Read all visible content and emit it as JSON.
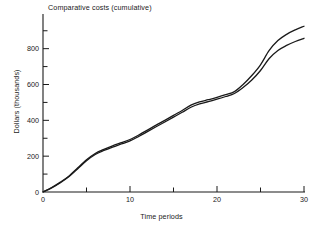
{
  "chart_data": {
    "type": "line",
    "title": "Comparative costs (cumulative)",
    "xlabel": "Time periods",
    "ylabel": "Dollars (thousands)",
    "xlim": [
      0,
      30
    ],
    "ylim": [
      0,
      960
    ],
    "grid": false,
    "legend": "none",
    "x_ticks_major": [
      0,
      10,
      20,
      30
    ],
    "x_ticks_major_labels": [
      "0",
      "10",
      "20",
      "30"
    ],
    "x_ticks_minor": [
      5,
      15,
      25
    ],
    "y_ticks_major": [
      0,
      200,
      400,
      600,
      800
    ],
    "y_ticks_major_labels": [
      "0",
      "200",
      "400",
      "600",
      "800"
    ],
    "y_ticks_minor": [
      100,
      300,
      500,
      700,
      900
    ],
    "x": [
      0,
      1,
      2,
      3,
      4,
      5,
      6,
      7,
      8,
      9,
      10,
      11,
      12,
      13,
      14,
      15,
      16,
      17,
      18,
      19,
      20,
      21,
      22,
      23,
      24,
      25,
      26,
      27,
      28,
      29,
      30
    ],
    "series": [
      {
        "name": "upper-curve",
        "color": "#1a1a1a",
        "values": [
          0,
          25,
          55,
          90,
          135,
          180,
          215,
          238,
          258,
          275,
          293,
          318,
          345,
          373,
          400,
          428,
          455,
          485,
          503,
          515,
          528,
          543,
          560,
          600,
          650,
          710,
          790,
          845,
          880,
          905,
          925
        ]
      },
      {
        "name": "lower-curve",
        "color": "#1a1a1a",
        "values": [
          0,
          23,
          52,
          86,
          130,
          174,
          209,
          232,
          251,
          268,
          285,
          310,
          337,
          364,
          391,
          418,
          445,
          473,
          492,
          504,
          518,
          533,
          550,
          583,
          625,
          678,
          745,
          790,
          818,
          840,
          858
        ]
      }
    ]
  }
}
